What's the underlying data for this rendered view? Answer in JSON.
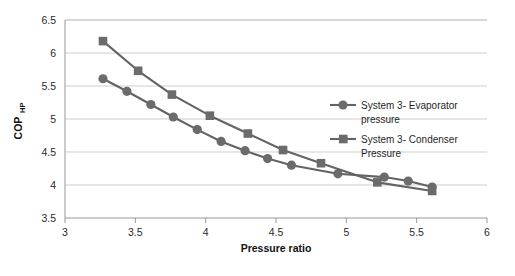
{
  "chart_data": {
    "type": "line",
    "title": "",
    "xlabel": "Pressure ratio",
    "ylabel": "COP",
    "ylabel_sub": "HP",
    "xlim": [
      3,
      6
    ],
    "ylim": [
      3.5,
      6.5
    ],
    "xticks": [
      "3",
      "3.5",
      "4",
      "4.5",
      "5",
      "5.5",
      "6"
    ],
    "xtick_values": [
      3,
      3.5,
      4,
      4.5,
      5,
      5.5,
      6
    ],
    "yticks": [
      "3.5",
      "4",
      "4.5",
      "5",
      "5.5",
      "6",
      "6.5"
    ],
    "ytick_values": [
      3.5,
      4,
      4.5,
      5,
      5.5,
      6,
      6.5
    ],
    "grid": "horizontal",
    "legend_position": "inside-right",
    "series": [
      {
        "name": "System 3- Evaporator pressure",
        "marker": "circle",
        "color": "#6b6b6b",
        "x": [
          3.27,
          3.44,
          3.61,
          3.77,
          3.94,
          4.11,
          4.28,
          4.44,
          4.61,
          4.94,
          5.27,
          5.44,
          5.61
        ],
        "y": [
          5.61,
          5.42,
          5.22,
          5.03,
          4.84,
          4.66,
          4.52,
          4.4,
          4.3,
          4.17,
          4.12,
          4.06,
          3.97
        ]
      },
      {
        "name": "System 3- Condenser Pressure",
        "marker": "square",
        "color": "#6b6b6b",
        "x": [
          3.27,
          3.52,
          3.76,
          4.03,
          4.3,
          4.55,
          4.82,
          5.22,
          5.61
        ],
        "y": [
          6.18,
          5.73,
          5.37,
          5.05,
          4.78,
          4.53,
          4.33,
          4.04,
          3.91
        ]
      }
    ],
    "legend": [
      {
        "label_line1": "System 3- Evaporator",
        "label_line2": "pressure",
        "marker": "circle"
      },
      {
        "label_line1": "System 3- Condenser",
        "label_line2": "Pressure",
        "marker": "square"
      }
    ]
  }
}
